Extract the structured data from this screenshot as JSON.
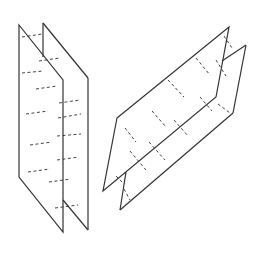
{
  "diagram": {
    "type": "intersecting-planes-illustration",
    "colors": {
      "edge": "#333333",
      "hidden": "#444444",
      "background": "#ffffff"
    },
    "figures": [
      {
        "name": "parallel-vertical-planes",
        "planes": [
          {
            "name": "front-plane",
            "points": [
              [
                19,
                25
              ],
              [
                63,
                80
              ],
              [
                63,
                232
              ],
              [
                19,
                177
              ]
            ]
          },
          {
            "name": "back-plane",
            "visible_edges": [
              [
                [
                  43,
                  23
                ],
                [
                  43,
                  57
                ]
              ],
              [
                [
                  43,
                  23
                ],
                [
                  88,
                  78
                ]
              ],
              [
                [
                  88,
                  78
                ],
                [
                  88,
                  230
                ]
              ],
              [
                [
                  63,
                  200
                ],
                [
                  88,
                  230
                ]
              ]
            ]
          }
        ],
        "dashes": [
          [
            [
              22,
              37
            ],
            [
              42,
              34
            ]
          ],
          [
            [
              39,
              61
            ],
            [
              60,
              58
            ]
          ],
          [
            [
              22,
              73
            ],
            [
              43,
              71
            ]
          ],
          [
            [
              36,
              89
            ],
            [
              57,
              86
            ]
          ],
          [
            [
              59,
              103
            ],
            [
              80,
              100
            ]
          ],
          [
            [
              26,
              114
            ],
            [
              48,
              111
            ]
          ],
          [
            [
              58,
              118
            ],
            [
              81,
              114
            ]
          ],
          [
            [
              30,
              145
            ],
            [
              52,
              142
            ]
          ],
          [
            [
              57,
              136
            ],
            [
              81,
              134
            ]
          ],
          [
            [
              28,
              172
            ],
            [
              50,
              169
            ]
          ],
          [
            [
              57,
              160
            ],
            [
              79,
              157
            ]
          ],
          [
            [
              49,
              182
            ],
            [
              71,
              179
            ]
          ],
          [
            [
              55,
              208
            ],
            [
              78,
              205
            ]
          ]
        ]
      },
      {
        "name": "slanted-planes",
        "planes": [
          {
            "name": "upper-plane",
            "points": [
              [
                117,
                118
              ],
              [
                229,
                27
              ],
              [
                216,
                97
              ],
              [
                103,
                191
              ]
            ]
          },
          {
            "name": "lower-plane",
            "visible_edges": [
              [
                [
                  126,
                  172
                ],
                [
                  120,
                  210
                ]
              ],
              [
                [
                  120,
                  210
                ],
                [
                  233,
                  113
                ]
              ],
              [
                [
                  233,
                  113
                ],
                [
                  246,
                  45
                ]
              ],
              [
                [
                  246,
                  45
                ],
                [
                  222,
                  61
                ]
              ]
            ]
          }
        ],
        "dashes": [
          [
            [
              125,
              128
            ],
            [
              136,
              142
            ]
          ],
          [
            [
              130,
              151
            ],
            [
              146,
              170
            ]
          ],
          [
            [
              116,
              176
            ],
            [
              124,
              184
            ]
          ],
          [
            [
              149,
              142
            ],
            [
              165,
              160
            ]
          ],
          [
            [
              152,
              111
            ],
            [
              166,
              127
            ]
          ],
          [
            [
              168,
              80
            ],
            [
              184,
              97
            ]
          ],
          [
            [
              174,
              120
            ],
            [
              188,
              136
            ]
          ],
          [
            [
              196,
              58
            ],
            [
              210,
              75
            ]
          ],
          [
            [
              200,
              97
            ],
            [
              212,
              111
            ]
          ],
          [
            [
              224,
              36
            ],
            [
              232,
              48
            ]
          ],
          [
            [
              216,
              60
            ],
            [
              226,
              76
            ]
          ],
          [
            [
              124,
              189
            ],
            [
              130,
              200
            ]
          ],
          [
            [
              218,
              104
            ],
            [
              230,
              113
            ]
          ]
        ]
      }
    ]
  }
}
